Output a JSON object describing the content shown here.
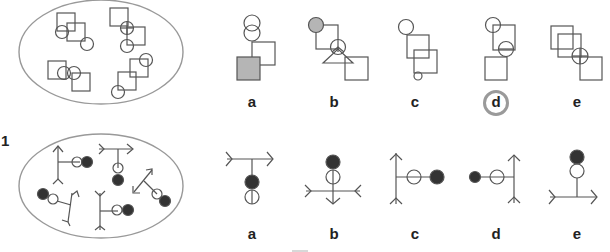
{
  "puzzles": [
    {
      "row_number": "",
      "description": "Square and circle arrangement puzzle",
      "options": [
        {
          "label": "a"
        },
        {
          "label": "b"
        },
        {
          "label": "c"
        },
        {
          "label": "d"
        },
        {
          "label": "e"
        }
      ],
      "highlighted_answer": "d"
    },
    {
      "row_number": "1",
      "description": "Arrow stick figures with open and filled circles",
      "options": [
        {
          "label": "a"
        },
        {
          "label": "b"
        },
        {
          "label": "c"
        },
        {
          "label": "d"
        },
        {
          "label": "e"
        }
      ]
    }
  ],
  "colors": {
    "stroke": "#555555",
    "ellipse_stroke": "#999999",
    "fill_gray": "#b5b5b5",
    "fill_dark": "#333333",
    "answer_ring": "#9a9a9a"
  }
}
